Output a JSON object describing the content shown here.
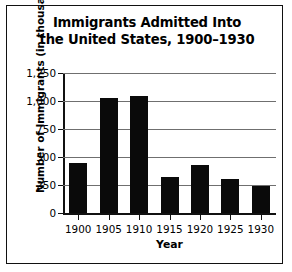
{
  "chart_data": {
    "type": "bar",
    "title": "Immigrants Admitted Into the United States, 1900–1930",
    "title_lines": [
      "Immigrants Admitted Into",
      "the United States, 1900–1930"
    ],
    "xlabel": "Year",
    "ylabel": "Number of Immigrants (in thousands)",
    "categories": [
      "1900",
      "1905",
      "1910",
      "1915",
      "1920",
      "1925",
      "1930"
    ],
    "values": [
      450,
      1030,
      1045,
      325,
      430,
      300,
      245
    ],
    "ylim": [
      0,
      1250
    ],
    "yticks": [
      0,
      250,
      500,
      750,
      1000,
      1250
    ],
    "ytick_labels": [
      "0",
      "250",
      "500",
      "750",
      "1,000",
      "1,250"
    ],
    "grid": true,
    "legend": null,
    "bar_color": "#0a0a0a",
    "grid_color": "#6f6f6f",
    "axis_color": "#111111",
    "background": "#ffffff"
  }
}
